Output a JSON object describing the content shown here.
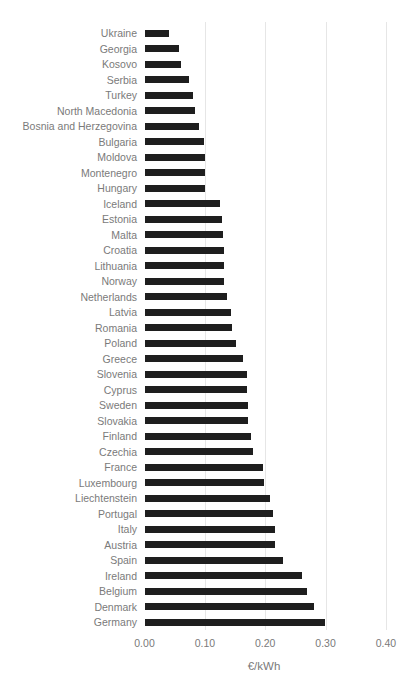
{
  "chart_data": {
    "type": "bar",
    "orientation": "horizontal",
    "title": "",
    "xlabel": "€/kWh",
    "ylabel": "",
    "xlim": [
      0,
      0.4
    ],
    "xticks": [
      "0.00",
      "0.10",
      "0.20",
      "0.30",
      "0.40"
    ],
    "grid": true,
    "legend": null,
    "bar_color": "#1e1e1e",
    "categories": [
      "Ukraine",
      "Georgia",
      "Kosovo",
      "Serbia",
      "Turkey",
      "North Macedonia",
      "Bosnia and Herzegovina",
      "Bulgaria",
      "Moldova",
      "Montenegro",
      "Hungary",
      "Iceland",
      "Estonia",
      "Malta",
      "Croatia",
      "Lithuania",
      "Norway",
      "Netherlands",
      "Latvia",
      "Romania",
      "Poland",
      "Greece",
      "Slovenia",
      "Cyprus",
      "Sweden",
      "Slovakia",
      "Finland",
      "Czechia",
      "France",
      "Luxembourg",
      "Liechtenstein",
      "Portugal",
      "Italy",
      "Austria",
      "Spain",
      "Ireland",
      "Belgium",
      "Denmark",
      "Germany"
    ],
    "values": [
      0.04,
      0.057,
      0.061,
      0.074,
      0.081,
      0.083,
      0.09,
      0.099,
      0.1,
      0.1,
      0.101,
      0.125,
      0.129,
      0.13,
      0.131,
      0.132,
      0.132,
      0.136,
      0.143,
      0.145,
      0.151,
      0.164,
      0.17,
      0.17,
      0.172,
      0.172,
      0.177,
      0.18,
      0.196,
      0.198,
      0.208,
      0.213,
      0.216,
      0.217,
      0.229,
      0.261,
      0.27,
      0.281,
      0.299
    ]
  }
}
